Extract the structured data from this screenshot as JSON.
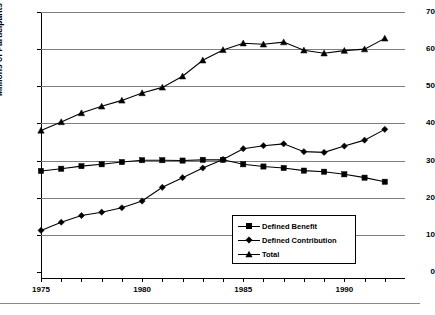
{
  "chart_data": {
    "type": "line",
    "title": "",
    "xlabel": "",
    "ylabel": "Millions of Participants",
    "xlim": [
      1975,
      1993
    ],
    "ylim": [
      0,
      70
    ],
    "ytick_labels": [
      "0",
      "10",
      "20",
      "30",
      "40",
      "50",
      "60",
      "70"
    ],
    "ytick_values": [
      0,
      10,
      20,
      30,
      40,
      50,
      60,
      70
    ],
    "xtick_values": [
      1975,
      1976,
      1977,
      1978,
      1979,
      1980,
      1981,
      1982,
      1983,
      1984,
      1985,
      1986,
      1987,
      1988,
      1989,
      1990,
      1991,
      1992
    ],
    "xtick_labels_shown": [
      "1975",
      "1980",
      "1985",
      "1990"
    ],
    "xtick_labels_shown_values": [
      1975,
      1980,
      1985,
      1990
    ],
    "grid": "horizontal",
    "legend_position": "lower-center-right",
    "x": [
      1975,
      1976,
      1977,
      1978,
      1979,
      1980,
      1981,
      1982,
      1983,
      1984,
      1985,
      1986,
      1987,
      1988,
      1989,
      1990,
      1991,
      1992
    ],
    "series": [
      {
        "name": "Defined Benefit",
        "marker": "square",
        "values": [
          27.2,
          27.8,
          28.5,
          29.0,
          29.6,
          30.1,
          30.1,
          30.0,
          30.2,
          30.2,
          29.0,
          28.4,
          28.0,
          27.3,
          27.0,
          26.3,
          25.4,
          24.3
        ]
      },
      {
        "name": "Defined Contribution",
        "marker": "diamond",
        "values": [
          11.2,
          13.4,
          15.2,
          16.1,
          17.3,
          19.1,
          22.8,
          25.4,
          28.0,
          30.3,
          33.2,
          34.0,
          34.5,
          32.4,
          32.2,
          33.9,
          35.5,
          38.4
        ]
      },
      {
        "name": "Total",
        "marker": "triangle",
        "values": [
          38.1,
          40.4,
          42.8,
          44.6,
          46.2,
          48.2,
          49.7,
          52.7,
          57.0,
          59.8,
          61.6,
          61.3,
          61.9,
          59.7,
          58.9,
          59.6,
          60.0,
          62.9
        ]
      }
    ]
  },
  "legend": {
    "items": [
      {
        "label": "Defined Benefit",
        "marker": "square"
      },
      {
        "label": "Defined Contribution",
        "marker": "diamond"
      },
      {
        "label": "Total",
        "marker": "triangle"
      }
    ]
  },
  "footer": {
    "caption_fragment": ""
  }
}
